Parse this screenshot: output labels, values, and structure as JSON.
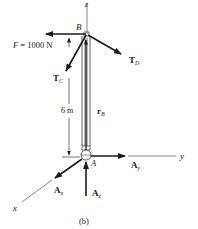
{
  "figure": {
    "caption": "(b)",
    "type": "free-body diagram"
  },
  "axes": {
    "x": {
      "label": "x"
    },
    "y": {
      "label": "y"
    },
    "z": {
      "label": "z"
    }
  },
  "points": {
    "B": {
      "label": "B"
    },
    "A": {
      "label": "A"
    }
  },
  "forces": {
    "F": {
      "label": "F = 1000 N"
    },
    "TC": {
      "main": "T",
      "sub": "C"
    },
    "TD": {
      "main": "T",
      "sub": "D"
    },
    "Ax": {
      "main": "A",
      "sub": "x"
    },
    "Ay": {
      "main": "A",
      "sub": "y"
    },
    "Az": {
      "main": "A",
      "sub": "z"
    }
  },
  "position_vector": {
    "main": "r",
    "sub": "B"
  },
  "dimension": {
    "label": "6 m"
  },
  "colors": {
    "ink": "#1a1a1a",
    "axis": "#555555",
    "background": "#ffffff"
  }
}
